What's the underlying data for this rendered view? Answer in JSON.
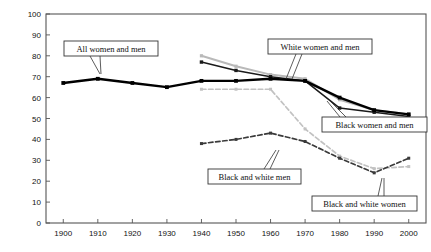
{
  "chart_data": {
    "type": "line",
    "title": "",
    "xlabel": "",
    "ylabel": "INDEX OF SEGREGATION",
    "xlim": [
      1895,
      2005
    ],
    "ylim": [
      0,
      100
    ],
    "grid": false,
    "legend_position": "inline-annotations",
    "x_ticks": [
      1900,
      1910,
      1920,
      1930,
      1940,
      1950,
      1960,
      1970,
      1980,
      1990,
      2000
    ],
    "y_ticks": [
      0,
      10,
      20,
      30,
      40,
      50,
      60,
      70,
      80,
      90,
      100
    ],
    "series": [
      {
        "name": "All women and men",
        "style": "solid-thick-black",
        "color": "#000000",
        "x": [
          1900,
          1910,
          1920,
          1930,
          1940,
          1950,
          1960,
          1970,
          1980,
          1990,
          2000
        ],
        "values": [
          67,
          69,
          67,
          65,
          68,
          68,
          69,
          68,
          60,
          54,
          52
        ]
      },
      {
        "name": "White women and men",
        "style": "solid-lightgray",
        "color": "#b9b9b9",
        "x": [
          1940,
          1950,
          1960,
          1970,
          1980,
          1990,
          2000
        ],
        "values": [
          80,
          75,
          71,
          69,
          59,
          54,
          52
        ]
      },
      {
        "name": "Black women and men",
        "style": "solid-black-thin",
        "color": "#1a1a1a",
        "x": [
          1940,
          1950,
          1960,
          1970,
          1980,
          1990,
          2000
        ],
        "values": [
          77,
          73,
          70,
          68,
          55,
          53,
          51
        ]
      },
      {
        "name": "Black and white men",
        "style": "dashed-dark",
        "color": "#3a3a3a",
        "x": [
          1940,
          1950,
          1960,
          1970,
          1980,
          1990,
          2000
        ],
        "values": [
          38,
          40,
          43,
          39,
          31,
          24,
          31
        ]
      },
      {
        "name": "Black and white women",
        "style": "dashed-lightgray",
        "color": "#c2c2c2",
        "x": [
          1940,
          1950,
          1960,
          1970,
          1980,
          1990,
          2000
        ],
        "values": [
          64,
          64,
          64,
          45,
          32,
          26,
          27
        ]
      }
    ],
    "annotations": [
      {
        "id": "all-women-and-men",
        "label": "All women and men"
      },
      {
        "id": "white-women-and-men",
        "label": "White women and men"
      },
      {
        "id": "black-women-and-men",
        "label": "Black women and men"
      },
      {
        "id": "black-and-white-men",
        "label": "Black and white men"
      },
      {
        "id": "black-and-white-women",
        "label": "Black and white women"
      }
    ]
  },
  "axis": {
    "y_label": "INDEX OF SEGREGATION",
    "y_ticks": [
      "100",
      "90",
      "80",
      "70",
      "60",
      "50",
      "40",
      "30",
      "20",
      "10",
      "0"
    ],
    "x_ticks": [
      "1900",
      "1910",
      "1920",
      "1930",
      "1940",
      "1950",
      "1960",
      "1970",
      "1980",
      "1990",
      "2000"
    ]
  },
  "annotations": {
    "all_women_and_men": "All women and men",
    "white_women_and_men": "White women and men",
    "black_women_and_men": "Black women and men",
    "black_and_white_men": "Black and white men",
    "black_and_white_women": "Black and white women"
  },
  "colors": {
    "axis": "#555555",
    "all_series": "#000000",
    "white_series": "#b9b9b9",
    "black_series": "#1a1a1a",
    "men_dashed": "#3a3a3a",
    "women_dashed": "#c2c2c2",
    "box_border": "#333333",
    "background": "#ffffff"
  }
}
